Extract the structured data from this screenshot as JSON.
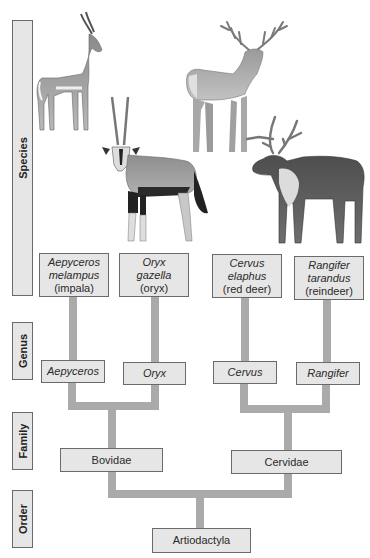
{
  "header": {
    "cropped_caption": ""
  },
  "ranks": [
    {
      "label": "Species"
    },
    {
      "label": "Genus"
    },
    {
      "label": "Family"
    },
    {
      "label": "Order"
    }
  ],
  "species": [
    {
      "scientific_line1": "Aepyceros",
      "scientific_line2": "melampus",
      "common": "(impala)"
    },
    {
      "scientific_line1": "Oryx",
      "scientific_line2": "gazella",
      "common": "(oryx)"
    },
    {
      "scientific_line1": "Cervus",
      "scientific_line2": "elaphus",
      "common": "(red deer)"
    },
    {
      "scientific_line1": "Rangifer",
      "scientific_line2": "tarandus",
      "common": "(reindeer)"
    }
  ],
  "genera": [
    {
      "label": "Aepyceros"
    },
    {
      "label": "Oryx"
    },
    {
      "label": "Cervus"
    },
    {
      "label": "Rangifer"
    }
  ],
  "families": [
    {
      "label": "Bovidae"
    },
    {
      "label": "Cervidae"
    }
  ],
  "order": {
    "label": "Artiodactyla"
  },
  "illustrations": [
    {
      "name": "impala",
      "icon": "impala-illustration"
    },
    {
      "name": "red deer",
      "icon": "red-deer-illustration"
    },
    {
      "name": "oryx",
      "icon": "oryx-illustration"
    },
    {
      "name": "reindeer",
      "icon": "reindeer-illustration"
    }
  ],
  "colors": {
    "box_fill": "#e6e6e6",
    "box_border": "#6a6a6a",
    "connector": "#aaaaaa"
  }
}
